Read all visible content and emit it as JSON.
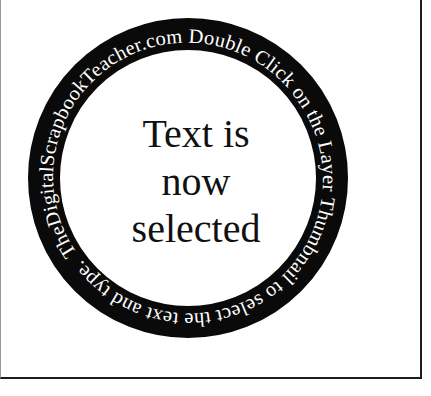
{
  "canvas": {
    "background_color": "#ffffff",
    "border_color": "#1c1c1c"
  },
  "badge": {
    "ring_text": "TheDigitalScrapbookTeacher.com Double Click on the Layer Thumbnail to select the text and type. ",
    "center_lines": [
      "Text is",
      "now",
      "selected"
    ],
    "ring_color": "#0a0a0a",
    "ring_text_color": "#ffffff",
    "center_text_color": "#111111"
  }
}
